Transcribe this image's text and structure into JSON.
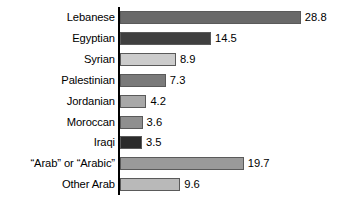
{
  "chart_data": {
    "type": "bar",
    "orientation": "horizontal",
    "title": "",
    "xlabel": "",
    "ylabel": "",
    "xlim": [
      0,
      30
    ],
    "grid": false,
    "legend": "none",
    "value_labels_shown": true,
    "categories": [
      "Lebanese",
      "Egyptian",
      "Syrian",
      "Palestinian",
      "Jordanian",
      "Moroccan",
      "Iraqi",
      "“Arab” or “Arabic”",
      "Other Arab"
    ],
    "values": [
      28.8,
      14.5,
      8.9,
      7.3,
      4.2,
      3.6,
      3.5,
      19.7,
      9.6
    ],
    "value_text": [
      "28.8",
      "14.5",
      "8.9",
      "7.3",
      "4.2",
      "3.6",
      "3.5",
      "19.7",
      "9.6"
    ],
    "bar_colors": [
      "#696969",
      "#3f3f3f",
      "#cccccc",
      "#7a7a7a",
      "#a8a8a8",
      "#8f8f8f",
      "#2b2b2b",
      "#9a9a9a",
      "#b9b9b9"
    ],
    "bar_edge_color": "#5a5a5a",
    "axis_color": "#000000",
    "background_color": "#ffffff",
    "text_color": "#000000"
  },
  "axis": {
    "name": "vertical-category-axis"
  }
}
